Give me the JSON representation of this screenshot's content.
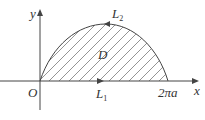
{
  "diagram": {
    "labels": {
      "y_axis": "y",
      "x_axis": "x",
      "origin": "O",
      "region": "D",
      "segment1": "L",
      "segment1_sub": "1",
      "curve2": "L",
      "curve2_sub": "2",
      "endpoint": "2πa"
    },
    "colors": {
      "stroke": "#444444",
      "background": "#ffffff"
    }
  }
}
